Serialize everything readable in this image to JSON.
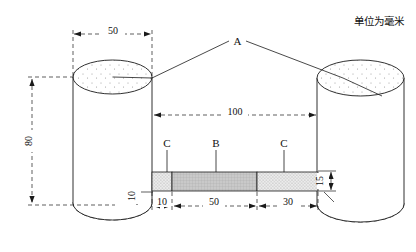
{
  "drawing": {
    "unit_note": "单位为毫米",
    "title_block": "",
    "labels": {
      "assembly_a": "A",
      "segment_b": "B",
      "segment_c_left": "C",
      "segment_c_right": "C"
    },
    "dimensions": {
      "cylinder_diameter": "50",
      "cylinder_height": "80",
      "overall_span": "100",
      "bar_left_segment": "10",
      "bar_middle_segment": "50",
      "bar_right_segment": "30",
      "bar_thickness_right": "15",
      "bar_offset_bottom": "10"
    },
    "colors": {
      "line": "#1a1a1a",
      "dimension_line": "#1a1a1a",
      "fill_b_segment": "#c9c9c9",
      "fill_c_segment": "#e3e3e3",
      "stipple_dot": "#8c8c8c",
      "background": "#ffffff"
    }
  }
}
